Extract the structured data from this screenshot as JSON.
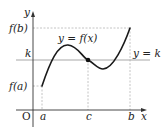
{
  "diagram": {
    "axes": {
      "x_label": "x",
      "y_label": "y",
      "origin_label": "O"
    },
    "x_ticks": [
      "a",
      "c",
      "b"
    ],
    "y_ticks": [
      "f(a)",
      "k",
      "f(b)"
    ],
    "curve_label": "y = f(x)",
    "line_label": "y = k",
    "points": [
      {
        "name": "intersection",
        "x_label": "c",
        "y_label": "k"
      }
    ],
    "colors": {
      "curve": "#1a1a1a",
      "k_line": "#a8a8a8",
      "guides": "#b0b0b0",
      "axes": "#333333"
    }
  }
}
